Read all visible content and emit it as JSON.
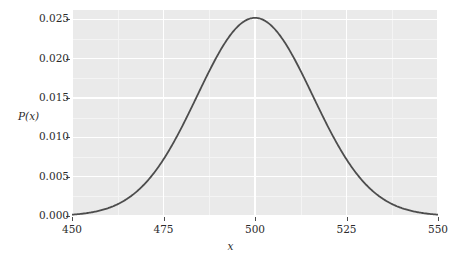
{
  "chart_data": {
    "type": "line",
    "title": "",
    "subtitle": "",
    "xlabel": "x",
    "ylabel": "P(x)",
    "xlim": [
      450,
      550
    ],
    "ylim": [
      0.0,
      0.0262
    ],
    "grid": true,
    "legend": null,
    "legend_position": "none",
    "x_ticks": [
      {
        "value": 450,
        "label": "450"
      },
      {
        "value": 475,
        "label": "475"
      },
      {
        "value": 500,
        "label": "500"
      },
      {
        "value": 525,
        "label": "525"
      },
      {
        "value": 550,
        "label": "550"
      }
    ],
    "y_ticks": [
      {
        "value": 0.025,
        "label": "0.025"
      },
      {
        "value": 0.02,
        "label": "0.020"
      },
      {
        "value": 0.015,
        "label": "0.015"
      },
      {
        "value": 0.01,
        "label": "0.010"
      },
      {
        "value": 0.005,
        "label": "0.005"
      },
      {
        "value": 0.0,
        "label": "0.000"
      }
    ],
    "series": [
      {
        "name": "P(x)",
        "color": "#4d4d4d",
        "linewidth": 1.8,
        "description": "Gaussian probability distribution centered at 500 with peak 0.0252",
        "x": [
          450,
          452,
          454,
          456,
          458,
          460,
          462,
          464,
          466,
          468,
          470,
          472,
          474,
          476,
          478,
          480,
          482,
          484,
          486,
          488,
          490,
          492,
          494,
          496,
          498,
          500,
          502,
          504,
          506,
          508,
          510,
          512,
          514,
          516,
          518,
          520,
          522,
          524,
          526,
          528,
          530,
          532,
          534,
          536,
          538,
          540,
          542,
          544,
          546,
          548,
          550
        ],
        "y": [
          0.00023,
          0.00036,
          0.00055,
          0.00083,
          0.00122,
          0.00176,
          0.00248,
          0.00342,
          0.00461,
          0.00608,
          0.00784,
          0.00988,
          0.01217,
          0.01466,
          0.01726,
          0.01986,
          0.02234,
          0.02456,
          0.0264,
          0.02776,
          0.02857,
          0.0288,
          0.02845,
          0.02757,
          0.02622,
          0.0252,
          0.02347,
          0.02124,
          0.01888,
          0.01648,
          0.01413,
          0.0119,
          0.00984,
          0.00799,
          0.00637,
          0.00498,
          0.00382,
          0.00287,
          0.00212,
          0.00153,
          0.00108,
          0.00075,
          0.00051,
          0.00034,
          0.00022,
          0.00014,
          9e-05,
          5e-05,
          3e-05,
          2e-05,
          0.00023
        ],
        "peak": {
          "x": 500,
          "y": 0.0252
        },
        "mean": 500,
        "std": 15.8
      }
    ],
    "colors": {
      "panel_background": "#eaeaea",
      "figure_background": "#ffffff",
      "gridline": "#ffffff",
      "minor_gridline": "#f4f4f4",
      "curve": "#4d4d4d",
      "text": "#2b2b2b",
      "tick": "#4d4d4d"
    }
  }
}
